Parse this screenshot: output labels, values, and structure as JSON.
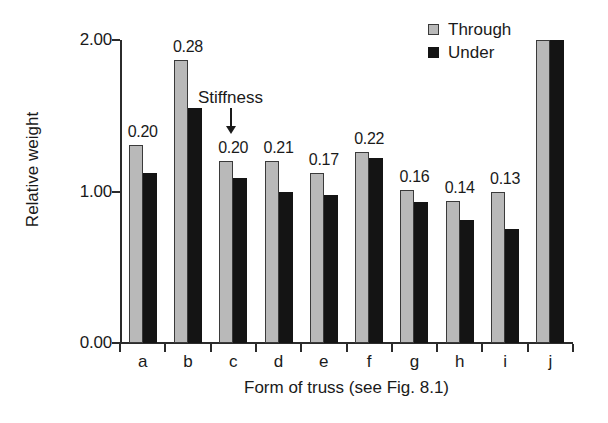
{
  "chart_data": {
    "type": "bar",
    "title": "",
    "xlabel": "Form of truss (see Fig. 8.1)",
    "ylabel": "Relative weight",
    "categories": [
      "a",
      "b",
      "c",
      "d",
      "e",
      "f",
      "g",
      "h",
      "i",
      "j"
    ],
    "series": [
      {
        "name": "Through",
        "color": "#b9b9b9",
        "values": [
          1.31,
          1.87,
          1.2,
          1.2,
          1.12,
          1.26,
          1.01,
          0.94,
          1.0,
          2.0
        ]
      },
      {
        "name": "Under",
        "color": "#141414",
        "values": [
          1.12,
          1.55,
          1.09,
          1.0,
          0.98,
          1.22,
          0.93,
          0.81,
          0.75,
          2.0
        ]
      }
    ],
    "point_labels": [
      "0.20",
      "0.28",
      "0.20",
      "0.21",
      "0.17",
      "0.22",
      "0.16",
      "0.14",
      "0.13",
      ""
    ],
    "ylim": [
      0.0,
      2.0
    ],
    "yticks": [
      "0.00",
      "1.00",
      "2.00"
    ],
    "ytick_values": [
      0.0,
      1.0,
      2.0
    ],
    "grid": false,
    "legend_position": "top-right",
    "annotation": {
      "text": "Stiffness",
      "points_to": "c"
    }
  },
  "legend": {
    "items": [
      {
        "label": "Through",
        "swatch": "through"
      },
      {
        "label": "Under",
        "swatch": "under"
      }
    ]
  }
}
